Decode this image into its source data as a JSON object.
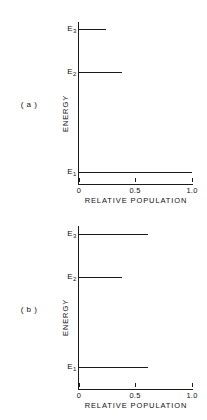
{
  "figure": {
    "panels": [
      {
        "id": "a",
        "label": "( a )",
        "xlabel": "RELATIVE  POPULATION",
        "ylabel": "ENERGY",
        "xticklabels": [
          "0",
          "0.5",
          "1.0"
        ],
        "levels": [
          {
            "name": "E",
            "sub": "3",
            "value": 0.24
          },
          {
            "name": "E",
            "sub": "2",
            "value": 0.38
          },
          {
            "name": "E",
            "sub": "1",
            "value": 1.0
          }
        ]
      },
      {
        "id": "b",
        "label": "( b )",
        "xlabel": "RELATIVE  POPULATION",
        "ylabel": "ENERGY",
        "xticklabels": [
          "0",
          "0.5",
          "1.0"
        ],
        "levels": [
          {
            "name": "E",
            "sub": "3",
            "value": 0.61
          },
          {
            "name": "E",
            "sub": "2",
            "value": 0.38
          },
          {
            "name": "E",
            "sub": "1",
            "value": 0.61
          }
        ]
      }
    ]
  },
  "chart_data": [
    {
      "type": "bar",
      "orientation": "horizontal",
      "title": "(a)",
      "categories": [
        "E1",
        "E2",
        "E3"
      ],
      "values": [
        1.0,
        0.38,
        0.24
      ],
      "xlabel": "RELATIVE  POPULATION",
      "ylabel": "ENERGY",
      "xlim": [
        0,
        1.0
      ],
      "xticks": [
        0,
        0.5,
        1.0
      ],
      "xticklabels": [
        "0",
        "0.5",
        "1.0"
      ],
      "yticklabels": [
        "E1",
        "E2",
        "E3"
      ],
      "grid": false,
      "legend": null
    },
    {
      "type": "bar",
      "orientation": "horizontal",
      "title": "(b)",
      "categories": [
        "E1",
        "E2",
        "E3"
      ],
      "values": [
        0.61,
        0.38,
        0.61
      ],
      "xlabel": "RELATIVE  POPULATION",
      "ylabel": "ENERGY",
      "xlim": [
        0,
        1.0
      ],
      "xticks": [
        0,
        0.5,
        1.0
      ],
      "xticklabels": [
        "0",
        "0.5",
        "1.0"
      ],
      "yticklabels": [
        "E1",
        "E2",
        "E3"
      ],
      "grid": false,
      "legend": null
    }
  ]
}
